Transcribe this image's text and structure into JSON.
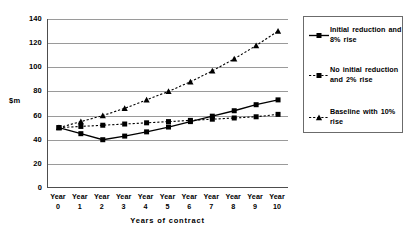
{
  "chart_data": {
    "type": "line",
    "title": "",
    "xlabel": "Years of contract",
    "ylabel": "$m",
    "ylim": [
      0,
      140
    ],
    "ytick_step": 20,
    "yticks": [
      140,
      120,
      100,
      80,
      60,
      40,
      20,
      0
    ],
    "grid": true,
    "legend_position": "right",
    "categories": [
      "Year 0",
      "Year 1",
      "Year 2",
      "Year 3",
      "Year 4",
      "Year 5",
      "Year 6",
      "Year 7",
      "Year 8",
      "Year 9",
      "Year 10"
    ],
    "x_tick_words": [
      "Year",
      "Year",
      "Year",
      "Year",
      "Year",
      "Year",
      "Year",
      "Year",
      "Year",
      "Year",
      "Year"
    ],
    "x_tick_numbers": [
      "0",
      "1",
      "2",
      "3",
      "4",
      "5",
      "6",
      "7",
      "8",
      "9",
      "10"
    ],
    "series": [
      {
        "name": "Initial reduction and 8% rise",
        "marker": "square",
        "linestyle": "solid",
        "color": "#000000",
        "values": [
          50,
          45,
          40,
          43,
          46.5,
          50.5,
          55,
          59.5,
          64,
          69,
          73
        ]
      },
      {
        "name": "No initial reduction and 2% rise",
        "marker": "square",
        "linestyle": "dotted",
        "color": "#000000",
        "values": [
          50,
          51,
          52,
          53,
          54,
          55,
          56,
          57,
          58,
          59,
          61
        ]
      },
      {
        "name": "Baseline with 10% rise",
        "marker": "triangle",
        "linestyle": "dotted",
        "color": "#000000",
        "values": [
          50,
          55,
          60,
          66,
          73,
          80,
          88,
          97,
          107,
          118,
          130
        ]
      }
    ]
  },
  "legend": {
    "entries": [
      {
        "label": "Initial reduction and 8% rise"
      },
      {
        "label": "No initial reduction and 2% rise"
      },
      {
        "label": "Baseline with 10% rise"
      }
    ]
  }
}
